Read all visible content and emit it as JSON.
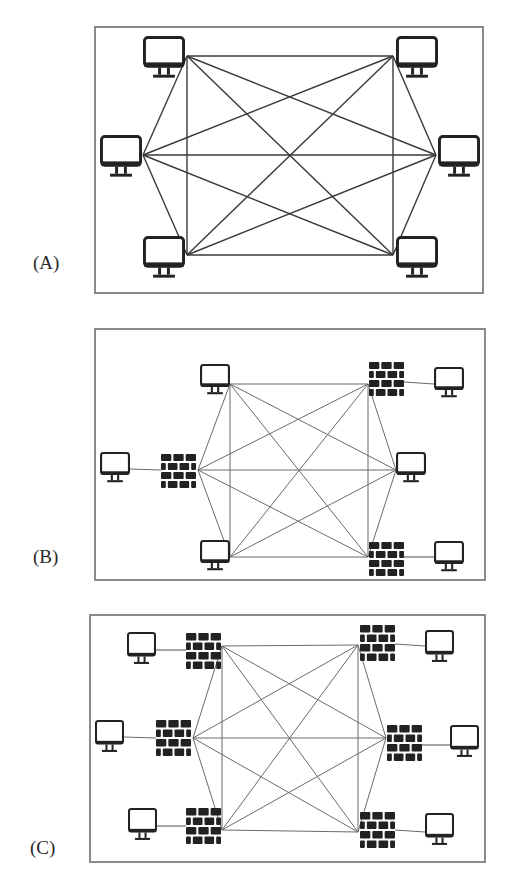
{
  "figure": {
    "panels": [
      {
        "id": "A",
        "label": "(A)",
        "label_pos": [
          33,
          272
        ],
        "frame": {
          "x": 95,
          "y": 27,
          "w": 388,
          "h": 266
        },
        "description": "Full mesh of six computers, no firewalls",
        "mesh_nodes": [
          {
            "name": "top-left",
            "type": "computer",
            "box": [
              143,
              36
            ],
            "hub": [
              187,
              56
            ]
          },
          {
            "name": "top-right",
            "type": "computer",
            "box": [
              396,
              36
            ],
            "hub": [
              393,
              56
            ]
          },
          {
            "name": "left",
            "type": "computer",
            "box": [
              100,
              135
            ],
            "hub": [
              143,
              155
            ]
          },
          {
            "name": "right",
            "type": "computer",
            "box": [
              438,
              135
            ],
            "hub": [
              436,
              155
            ]
          },
          {
            "name": "bottom-left",
            "type": "computer",
            "box": [
              143,
              236
            ],
            "hub": [
              187,
              255
            ]
          },
          {
            "name": "bottom-right",
            "type": "computer",
            "box": [
              396,
              236
            ],
            "hub": [
              393,
              255
            ]
          }
        ],
        "outer_nodes": [],
        "computer_size": [
          42,
          44
        ],
        "line_width": 1.4,
        "line_color": "#3a3a3a"
      },
      {
        "id": "B",
        "label": "(B)",
        "label_pos": [
          33,
          566
        ],
        "frame": {
          "x": 95,
          "y": 329,
          "w": 390,
          "h": 251
        },
        "description": "Full mesh where three nodes are firewalls protecting outer computers",
        "mesh_nodes": [
          {
            "name": "top-left",
            "type": "computer",
            "box": [
              200,
              364
            ],
            "hub": [
              230,
              384
            ]
          },
          {
            "name": "top-right",
            "type": "firewall",
            "box": [
              369,
              362
            ],
            "hub": [
              368,
              384
            ]
          },
          {
            "name": "left",
            "type": "firewall",
            "box": [
              161,
              454
            ],
            "hub": [
              198,
              470
            ]
          },
          {
            "name": "right",
            "type": "computer",
            "box": [
              396,
              452
            ],
            "hub": [
              396,
              470
            ]
          },
          {
            "name": "bottom-left",
            "type": "computer",
            "box": [
              200,
              540
            ],
            "hub": [
              230,
              557
            ]
          },
          {
            "name": "bottom-right",
            "type": "firewall",
            "box": [
              369,
              542
            ],
            "hub": [
              368,
              557
            ]
          }
        ],
        "outer_nodes": [
          {
            "name": "outer-left",
            "type": "computer",
            "box": [
              100,
              452
            ],
            "link_from": [
              129,
              469
            ],
            "link_to": [
              161,
              470
            ]
          },
          {
            "name": "outer-top-right",
            "type": "computer",
            "box": [
              434,
              367
            ],
            "link_from": [
              404,
              382
            ],
            "link_to": [
              434,
              384
            ]
          },
          {
            "name": "outer-bottom-right",
            "type": "computer",
            "box": [
              434,
              541
            ],
            "link_from": [
              404,
              557
            ],
            "link_to": [
              434,
              557
            ]
          }
        ],
        "computer_size": [
          30,
          32
        ],
        "firewall_size": [
          35,
          34
        ],
        "line_width": 1,
        "line_color": "#6a6a6a"
      },
      {
        "id": "C",
        "label": "(C)",
        "label_pos": [
          30,
          857
        ],
        "frame": {
          "x": 90,
          "y": 615,
          "w": 395,
          "h": 247
        },
        "description": "Full mesh of six firewalls, each protecting one outer computer",
        "mesh_nodes": [
          {
            "name": "top-left",
            "type": "firewall",
            "box": [
              186,
              633
            ],
            "hub": [
              222,
              646
            ]
          },
          {
            "name": "top-right",
            "type": "firewall",
            "box": [
              360,
              625
            ],
            "hub": [
              358,
              645
            ]
          },
          {
            "name": "left",
            "type": "firewall",
            "box": [
              156,
              720
            ],
            "hub": [
              193,
              738
            ]
          },
          {
            "name": "right",
            "type": "firewall",
            "box": [
              387,
              725
            ],
            "hub": [
              386,
              738
            ]
          },
          {
            "name": "bottom-left",
            "type": "firewall",
            "box": [
              186,
              808
            ],
            "hub": [
              222,
              830
            ]
          },
          {
            "name": "bottom-right",
            "type": "firewall",
            "box": [
              360,
              812
            ],
            "hub": [
              358,
              832
            ]
          }
        ],
        "outer_nodes": [
          {
            "name": "outer-top-left",
            "type": "computer",
            "box": [
              127,
              632
            ],
            "link_from": [
              155,
              650
            ],
            "link_to": [
              186,
              650
            ]
          },
          {
            "name": "outer-left",
            "type": "computer",
            "box": [
              95,
              720
            ],
            "link_from": [
              124,
              737
            ],
            "link_to": [
              156,
              738
            ]
          },
          {
            "name": "outer-bottom-left",
            "type": "computer",
            "box": [
              128,
              808
            ],
            "link_from": [
              156,
              826
            ],
            "link_to": [
              186,
              826
            ]
          },
          {
            "name": "outer-top-right",
            "type": "computer",
            "box": [
              425,
              630
            ],
            "link_from": [
              395,
              644
            ],
            "link_to": [
              425,
              646
            ]
          },
          {
            "name": "outer-right",
            "type": "computer",
            "box": [
              450,
              725
            ],
            "link_from": [
              421,
              745
            ],
            "link_to": [
              450,
              745
            ]
          },
          {
            "name": "outer-bottom-right",
            "type": "computer",
            "box": [
              425,
              813
            ],
            "link_from": [
              395,
              830
            ],
            "link_to": [
              425,
              832
            ]
          }
        ],
        "computer_size": [
          29,
          34
        ],
        "firewall_size": [
          35,
          36
        ],
        "line_width": 1,
        "line_color": "#6a6a6a"
      }
    ],
    "colors": {
      "frame": "#8a8a8a",
      "icon": "#222222",
      "label": "#2a2a2a",
      "background": "#ffffff"
    }
  }
}
